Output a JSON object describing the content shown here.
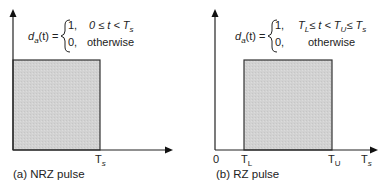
{
  "panels": [
    {
      "id": "a",
      "caption": "(a) NRZ pulse",
      "equation": {
        "lhs_func": "d",
        "lhs_sub": "a",
        "lhs_arg": "(t) =",
        "case1_value": "1,",
        "case1_cond": "0 ≤ t < T",
        "case1_cond_sub": "s",
        "case2_value": "0,",
        "case2_cond": "otherwise"
      },
      "x_labels": [
        {
          "main": "T",
          "sub": "s"
        }
      ],
      "pulse_fill": "#d4d4d4"
    },
    {
      "id": "b",
      "caption": "(b) RZ pulse",
      "equation": {
        "lhs_func": "d",
        "lhs_sub": "a",
        "lhs_arg": "(t) =",
        "case1_value": "1,",
        "case1_cond_a": "T",
        "case1_cond_a_sub": "L",
        "case1_cond_b": "≤ t < T",
        "case1_cond_b_sub": "U",
        "case1_cond_c": "≤ T",
        "case1_cond_c_sub": "s",
        "case2_value": "0,",
        "case2_cond": "otherwise"
      },
      "x_labels": [
        {
          "main": "0",
          "sub": ""
        },
        {
          "main": "T",
          "sub": "L"
        },
        {
          "main": "T",
          "sub": "U"
        },
        {
          "main": "T",
          "sub": "s"
        }
      ],
      "pulse_fill": "#d4d4d4"
    }
  ]
}
